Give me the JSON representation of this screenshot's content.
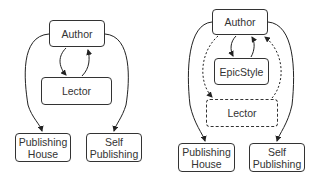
{
  "diagrams": [
    {
      "name": "baseline",
      "nodes": {
        "author": "Author",
        "lector": "Lector",
        "publishing_house": "Publishing\nHouse",
        "self_publishing": "Self\nPublishing"
      },
      "edges": [
        {
          "from": "Author",
          "to": "Lector",
          "style": "solid"
        },
        {
          "from": "Lector",
          "to": "Author",
          "style": "solid"
        },
        {
          "from": "Author",
          "to": "Publishing House",
          "style": "solid"
        },
        {
          "from": "Author",
          "to": "Self Publishing",
          "style": "solid"
        }
      ]
    },
    {
      "name": "with-epicstyle",
      "nodes": {
        "author": "Author",
        "epicstyle": "EpicStyle",
        "lector": "Lector",
        "publishing_house": "Publishing\nHouse",
        "self_publishing": "Self\nPublishing"
      },
      "edges": [
        {
          "from": "Author",
          "to": "EpicStyle",
          "style": "solid"
        },
        {
          "from": "EpicStyle",
          "to": "Author",
          "style": "solid"
        },
        {
          "from": "Author",
          "to": "Lector",
          "style": "dashed"
        },
        {
          "from": "Lector",
          "to": "Author",
          "style": "dashed"
        },
        {
          "from": "Author",
          "to": "Publishing House",
          "style": "solid"
        },
        {
          "from": "Author",
          "to": "Self Publishing",
          "style": "solid"
        }
      ],
      "optional_nodes": [
        "Lector"
      ]
    }
  ]
}
